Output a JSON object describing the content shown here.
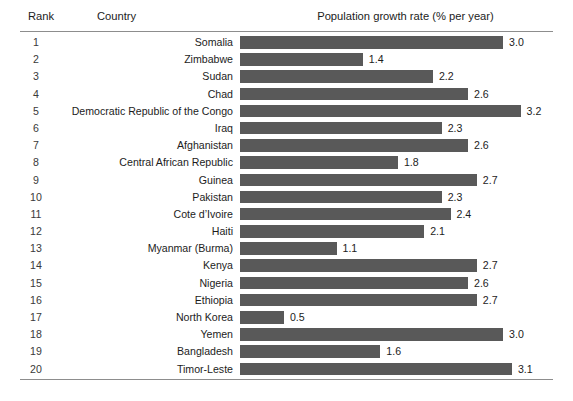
{
  "table": {
    "columns": {
      "rank": "Rank",
      "country": "Country",
      "value": "Population growth rate (% per year)"
    },
    "bar_color": "#595959",
    "rule_color": "#8d8d8d"
  },
  "chart_data": {
    "type": "bar",
    "title": "Population growth rate (% per year)",
    "xlabel": "Population growth rate (% per year)",
    "ylabel": "Country",
    "orientation": "horizontal",
    "xlim": [
      0,
      3.3
    ],
    "grid": false,
    "legend": null,
    "categories": [
      "Somalia",
      "Zimbabwe",
      "Sudan",
      "Chad",
      "Democratic Republic of the Congo",
      "Iraq",
      "Afghanistan",
      "Central African Republic",
      "Guinea",
      "Pakistan",
      "Cote d’Ivoire",
      "Haiti",
      "Myanmar (Burma)",
      "Kenya",
      "Nigeria",
      "Ethiopia",
      "North Korea",
      "Yemen",
      "Bangladesh",
      "Timor-Leste"
    ],
    "ranks": [
      1,
      2,
      3,
      4,
      5,
      6,
      7,
      8,
      9,
      10,
      11,
      12,
      13,
      14,
      15,
      16,
      17,
      18,
      19,
      20
    ],
    "values": [
      3.0,
      1.4,
      2.2,
      2.6,
      3.2,
      2.3,
      2.6,
      1.8,
      2.7,
      2.3,
      2.4,
      2.1,
      1.1,
      2.7,
      2.6,
      2.7,
      0.5,
      3.0,
      1.6,
      3.1
    ],
    "value_labels": [
      "3.0",
      "1.4",
      "2.2",
      "2.6",
      "3.2",
      "2.3",
      "2.6",
      "1.8",
      "2.7",
      "2.3",
      "2.4",
      "2.1",
      "1.1",
      "2.7",
      "2.6",
      "2.7",
      "0.5",
      "3.0",
      "1.6",
      "3.1"
    ],
    "rank_labels": [
      "1",
      "2",
      "3",
      "4",
      "5",
      "6",
      "7",
      "8",
      "9",
      "10",
      "11",
      "12",
      "13",
      "14",
      "15",
      "16",
      "17",
      "18",
      "19",
      "20"
    ]
  }
}
